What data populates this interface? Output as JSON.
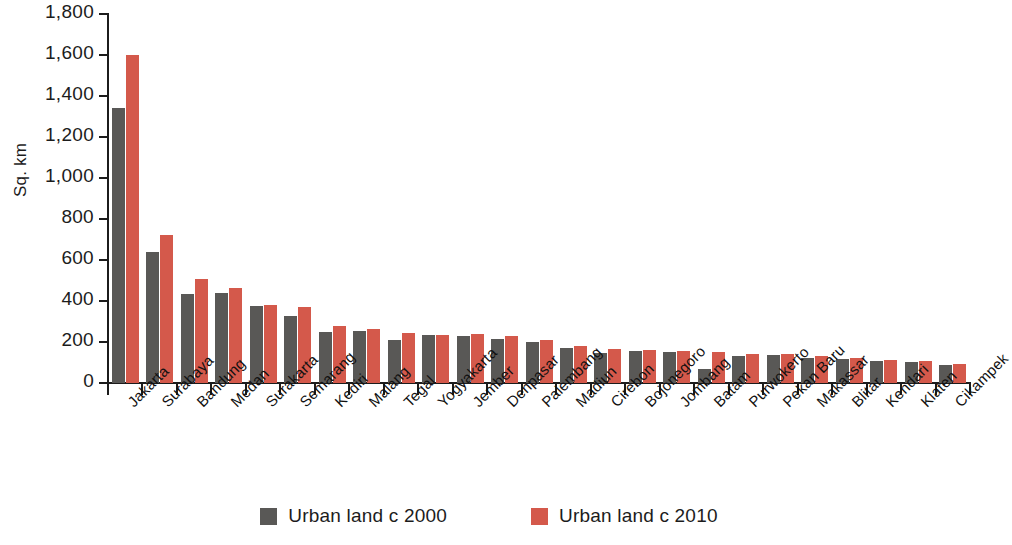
{
  "chart_data": {
    "type": "bar",
    "title": "",
    "xlabel": "",
    "ylabel": "Sq. km",
    "ylim": [
      0,
      1800
    ],
    "ytick_step": 200,
    "grid": false,
    "legend_position": "bottom-center",
    "orientation": "vertical",
    "bar_mode": "grouped",
    "categories": [
      "Jakarta",
      "Surabaya",
      "Bandung",
      "Medan",
      "Surakarta",
      "Semarang",
      "Kediri",
      "Malang",
      "Tegal",
      "Yogyakarta",
      "Jember",
      "Denpasar",
      "Palembang",
      "Madiun",
      "Cirebon",
      "Bojonegoro",
      "Jombang",
      "Batam",
      "Purwokerto",
      "Pekan Baru",
      "Makassar",
      "Blitar",
      "Kendari",
      "Klaten",
      "Cikampek"
    ],
    "ytick_labels": [
      "0",
      "200",
      "400",
      "600",
      "800",
      "1,000",
      "1,200",
      "1,400",
      "1,600",
      "1,800"
    ],
    "series": [
      {
        "name": "Urban land c 2000",
        "color": "#595856",
        "values": [
          1340,
          640,
          432,
          440,
          378,
          328,
          250,
          252,
          212,
          232,
          230,
          215,
          200,
          172,
          148,
          158,
          152,
          70,
          130,
          136,
          122,
          116,
          108,
          104,
          88
        ]
      },
      {
        "name": "Urban land c 2010",
        "color": "#d4594b",
        "values": [
          1600,
          722,
          506,
          462,
          380,
          370,
          276,
          262,
          242,
          236,
          238,
          228,
          208,
          180,
          168,
          162,
          158,
          152,
          142,
          140,
          132,
          120,
          112,
          108,
          92
        ]
      }
    ]
  },
  "legend": {
    "items": [
      {
        "label": "Urban land c 2000",
        "color": "#595856"
      },
      {
        "label": "Urban land c 2010",
        "color": "#d4594b"
      }
    ]
  },
  "axis": {
    "y_title": "Sq. km"
  }
}
